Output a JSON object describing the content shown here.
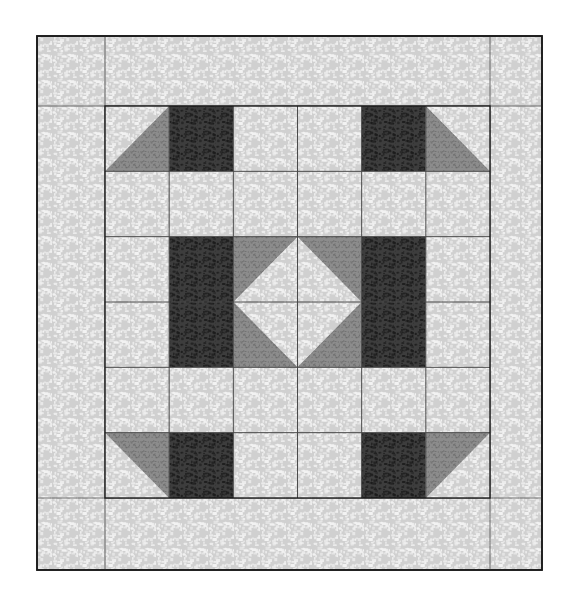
{
  "figure": {
    "type": "quilt-block-schematic",
    "canvas": {
      "width": 578,
      "height": 615,
      "background": "#ffffff"
    }
  },
  "colors": {
    "page_background": "#ffffff",
    "outline": "#1a1a1a",
    "grid_line": "#4a4a4a",
    "light_fabric_base": "#d0d0d0",
    "light_fabric_speckle": "#f2f2f2",
    "medium_fabric_base": "#8c8c8c",
    "medium_fabric_speckle": "#6a6a6a",
    "dark_fabric_base": "#3d3d3d",
    "dark_fabric_speckle": "#1b1b1b"
  },
  "fabrics": [
    {
      "id": "light",
      "name": "light-mottled-fabric",
      "tone": "light",
      "hex": "#d0d0d0"
    },
    {
      "id": "medium",
      "name": "medium-gray-fabric",
      "tone": "medium",
      "hex": "#8c8c8c"
    },
    {
      "id": "dark",
      "name": "dark-textured-fabric",
      "tone": "dark",
      "hex": "#3d3d3d"
    }
  ],
  "outer_border": {
    "name": "quilt-outer-border",
    "x": 37,
    "y": 36,
    "width": 505,
    "height": 534,
    "fabric": "light",
    "stroke": "#1a1a1a",
    "stroke_width": 1.6
  },
  "inner_block": {
    "name": "quilt-center-block",
    "x": 105,
    "y": 106,
    "width": 385,
    "height": 392,
    "rows": 6,
    "cols": 6,
    "cell_width": 64.17,
    "cell_height": 65.33,
    "stroke": "#1a1a1a",
    "stroke_width": 1.4,
    "grid_stroke": "#4a4a4a",
    "grid_stroke_width": 1
  },
  "chart_data": {
    "type": "table",
    "xlabel": "column",
    "ylabel": "row",
    "categories": [
      "c1",
      "c2",
      "c3",
      "c4",
      "c5",
      "c6"
    ],
    "row_labels": [
      "r1",
      "r2",
      "r3",
      "r4",
      "r5",
      "r6"
    ],
    "legend": [
      "light",
      "medium",
      "dark"
    ],
    "cells": [
      [
        {
          "unit": "hst-tri-br",
          "base": "light",
          "tri": "medium",
          "corner": "br"
        },
        {
          "unit": "solid",
          "base": "dark"
        },
        {
          "unit": "solid",
          "base": "light"
        },
        {
          "unit": "solid",
          "base": "light"
        },
        {
          "unit": "solid",
          "base": "dark"
        },
        {
          "unit": "hst-tri-bl",
          "base": "light",
          "tri": "medium",
          "corner": "bl"
        }
      ],
      [
        {
          "unit": "solid",
          "base": "light"
        },
        {
          "unit": "solid",
          "base": "light"
        },
        {
          "unit": "solid",
          "base": "light"
        },
        {
          "unit": "solid",
          "base": "light"
        },
        {
          "unit": "solid",
          "base": "light"
        },
        {
          "unit": "solid",
          "base": "light"
        }
      ],
      [
        {
          "unit": "solid",
          "base": "light"
        },
        {
          "unit": "solid",
          "base": "dark"
        },
        {
          "unit": "hst-tri-tl",
          "base": "light",
          "tri": "medium",
          "corner": "tl"
        },
        {
          "unit": "hst-tri-tr",
          "base": "light",
          "tri": "medium",
          "corner": "tr"
        },
        {
          "unit": "solid",
          "base": "dark"
        },
        {
          "unit": "solid",
          "base": "light"
        }
      ],
      [
        {
          "unit": "solid",
          "base": "light"
        },
        {
          "unit": "solid",
          "base": "dark"
        },
        {
          "unit": "hst-tri-bl",
          "base": "light",
          "tri": "medium",
          "corner": "bl"
        },
        {
          "unit": "hst-tri-br",
          "base": "light",
          "tri": "medium",
          "corner": "br"
        },
        {
          "unit": "solid",
          "base": "dark"
        },
        {
          "unit": "solid",
          "base": "light"
        }
      ],
      [
        {
          "unit": "solid",
          "base": "light"
        },
        {
          "unit": "solid",
          "base": "light"
        },
        {
          "unit": "solid",
          "base": "light"
        },
        {
          "unit": "solid",
          "base": "light"
        },
        {
          "unit": "solid",
          "base": "light"
        },
        {
          "unit": "solid",
          "base": "light"
        }
      ],
      [
        {
          "unit": "hst-tri-tr",
          "base": "light",
          "tri": "medium",
          "corner": "tr"
        },
        {
          "unit": "solid",
          "base": "dark"
        },
        {
          "unit": "solid",
          "base": "light"
        },
        {
          "unit": "solid",
          "base": "light"
        },
        {
          "unit": "solid",
          "base": "dark"
        },
        {
          "unit": "hst-tri-tl",
          "base": "light",
          "tri": "medium",
          "corner": "tl"
        }
      ]
    ]
  }
}
